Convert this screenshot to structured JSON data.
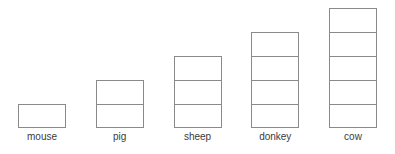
{
  "chart_data": {
    "type": "bar",
    "title": "",
    "subtitle": "",
    "xlabel": "",
    "ylabel": "",
    "categories": [
      "mouse",
      "pig",
      "sheep",
      "donkey",
      "cow"
    ],
    "values": [
      1,
      2,
      3,
      4,
      5
    ],
    "unit_note": "each bar is drawn as a stack of equal-size rectangular unit cells; value = number of cells",
    "ylim": [
      0,
      5
    ],
    "grid": false,
    "legend": null,
    "annotations": [],
    "style": {
      "background_color": "#ffffff",
      "bar_fill_color": "#ffffff",
      "bar_outline_color": "#8a8a8a",
      "label_color": "#3b3b3b"
    }
  }
}
